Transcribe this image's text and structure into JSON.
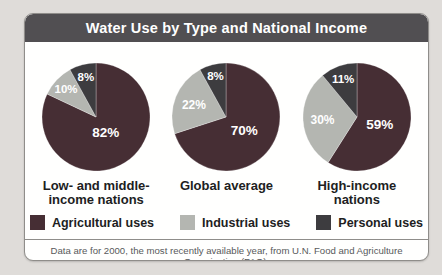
{
  "page": {
    "title": "Water Use by Type and National Income"
  },
  "colors": {
    "title_bar": "#514f52",
    "agricultural": "#462e34",
    "industrial": "#b4b6b1",
    "personal": "#3d3c3f"
  },
  "chart_data": [
    {
      "type": "pie",
      "title": "Low- and middle-income nations",
      "caption": "Low- and middle-\nincome nations",
      "categories": [
        "Agricultural uses",
        "Industrial uses",
        "Personal uses"
      ],
      "values": [
        82,
        10,
        8
      ],
      "slices": [
        {
          "label": "Agricultural uses",
          "color": "agricultural",
          "value": 82,
          "display": "82%",
          "label_r": 0.34,
          "fs": 13.5
        },
        {
          "label": "Industrial uses",
          "color": "industrial",
          "value": 10,
          "display": "10%",
          "label_r": 0.76,
          "fs": 11.5
        },
        {
          "label": "Personal uses",
          "color": "personal",
          "value": 8,
          "display": "8%",
          "label_r": 0.76,
          "fs": 11.5
        }
      ]
    },
    {
      "type": "pie",
      "title": "Global average",
      "caption": "Global average",
      "categories": [
        "Agricultural uses",
        "Industrial uses",
        "Personal uses"
      ],
      "values": [
        70,
        22,
        8
      ],
      "slices": [
        {
          "label": "Agricultural uses",
          "color": "agricultural",
          "value": 70,
          "display": "70%",
          "label_r": 0.42,
          "fs": 13.5
        },
        {
          "label": "Industrial uses",
          "color": "industrial",
          "value": 22,
          "display": "22%",
          "label_r": 0.64,
          "fs": 12
        },
        {
          "label": "Personal uses",
          "color": "personal",
          "value": 8,
          "display": "8%",
          "label_r": 0.78,
          "fs": 11.5
        }
      ]
    },
    {
      "type": "pie",
      "title": "High-income nations",
      "caption": "High-income\nnations",
      "categories": [
        "Agricultural uses",
        "Industrial uses",
        "Personal uses"
      ],
      "values": [
        59,
        30,
        11
      ],
      "slices": [
        {
          "label": "Agricultural uses",
          "color": "agricultural",
          "value": 59,
          "display": "59%",
          "label_r": 0.44,
          "fs": 13.5
        },
        {
          "label": "Industrial uses",
          "color": "industrial",
          "value": 30,
          "display": "30%",
          "label_r": 0.64,
          "fs": 12
        },
        {
          "label": "Personal uses",
          "color": "personal",
          "value": 11,
          "display": "11%",
          "label_r": 0.76,
          "fs": 11.5
        }
      ]
    }
  ],
  "legend": {
    "items": [
      {
        "label": "Agricultural uses",
        "color": "agricultural"
      },
      {
        "label": "Industrial uses",
        "color": "industrial"
      },
      {
        "label": "Personal uses",
        "color": "personal"
      }
    ]
  },
  "footnote": "Data are for 2000, the most recently available year, from U.N. Food and Agriculture Organization (FAO)."
}
